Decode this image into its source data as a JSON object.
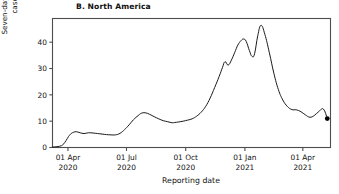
{
  "figure": {
    "panel_title": "B. North America",
    "xlabel": "Reporting date",
    "ylabel": "Seven-day rolling average, confirmed\ncases per 100,000 people",
    "line_color": "#1a1a1a",
    "marker_color": "#000000",
    "frame_color": "#4d4d4d",
    "background": "#ffffff"
  },
  "chart_data": {
    "type": "line",
    "title": "B. North America",
    "xlabel": "Reporting date",
    "ylabel": "Seven-day rolling average, confirmed cases per 100,000 people",
    "ylim": [
      0,
      49
    ],
    "yticks": [
      0,
      10,
      20,
      30,
      40
    ],
    "ytick_labels": [
      "0",
      "10",
      "20",
      "30",
      "40"
    ],
    "xticks": [
      "2020-04-01",
      "2020-07-01",
      "2020-10-01",
      "2021-01-01",
      "2021-04-01"
    ],
    "xtick_labels": [
      [
        "01 Apr",
        "2020"
      ],
      [
        "01 Jul",
        "2020"
      ],
      [
        "01 Oct",
        "2020"
      ],
      [
        "01 Jan",
        "2021"
      ],
      [
        "01 Apr",
        "2021"
      ]
    ],
    "xlim": [
      "2020-03-08",
      "2021-05-14"
    ],
    "grid": false,
    "legend": false,
    "end_marker": {
      "x": "2021-05-09",
      "y": 11.0,
      "style": "filled-circle"
    },
    "series": [
      {
        "name": "North America seven-day rolling average",
        "x": [
          "2020-03-08",
          "2020-03-15",
          "2020-03-22",
          "2020-03-25",
          "2020-03-29",
          "2020-04-02",
          "2020-04-06",
          "2020-04-10",
          "2020-04-14",
          "2020-04-20",
          "2020-04-26",
          "2020-05-03",
          "2020-05-10",
          "2020-05-17",
          "2020-05-24",
          "2020-05-31",
          "2020-06-07",
          "2020-06-14",
          "2020-06-21",
          "2020-06-28",
          "2020-07-05",
          "2020-07-12",
          "2020-07-19",
          "2020-07-24",
          "2020-07-30",
          "2020-08-06",
          "2020-08-13",
          "2020-08-20",
          "2020-08-27",
          "2020-09-03",
          "2020-09-10",
          "2020-09-14",
          "2020-09-20",
          "2020-09-27",
          "2020-10-04",
          "2020-10-11",
          "2020-10-18",
          "2020-10-25",
          "2020-11-01",
          "2020-11-08",
          "2020-11-15",
          "2020-11-22",
          "2020-11-27",
          "2020-12-01",
          "2020-12-06",
          "2020-12-11",
          "2020-12-16",
          "2020-12-21",
          "2020-12-26",
          "2020-12-30",
          "2021-01-03",
          "2021-01-08",
          "2021-01-12",
          "2021-01-16",
          "2021-01-21",
          "2021-01-26",
          "2021-02-01",
          "2021-02-08",
          "2021-02-15",
          "2021-02-22",
          "2021-03-01",
          "2021-03-08",
          "2021-03-15",
          "2021-03-22",
          "2021-03-29",
          "2021-04-05",
          "2021-04-12",
          "2021-04-19",
          "2021-04-26",
          "2021-05-03",
          "2021-05-09"
        ],
        "y": [
          0.2,
          0.3,
          0.7,
          1.3,
          2.6,
          4.2,
          5.3,
          5.8,
          6.0,
          5.6,
          5.3,
          5.6,
          5.5,
          5.3,
          5.1,
          4.9,
          4.8,
          4.8,
          5.4,
          6.8,
          8.6,
          10.6,
          12.1,
          13.0,
          13.2,
          12.6,
          11.7,
          10.9,
          10.2,
          9.8,
          9.4,
          9.5,
          9.7,
          10.0,
          10.4,
          10.9,
          11.9,
          13.4,
          15.6,
          18.8,
          22.8,
          27.0,
          30.3,
          32.6,
          31.3,
          33.2,
          36.0,
          38.9,
          40.6,
          41.2,
          40.3,
          36.8,
          34.6,
          35.6,
          42.5,
          46.4,
          43.0,
          36.0,
          28.2,
          22.0,
          18.0,
          15.6,
          14.4,
          14.3,
          13.6,
          12.4,
          11.5,
          12.2,
          13.7,
          14.6,
          11.0
        ]
      }
    ]
  }
}
